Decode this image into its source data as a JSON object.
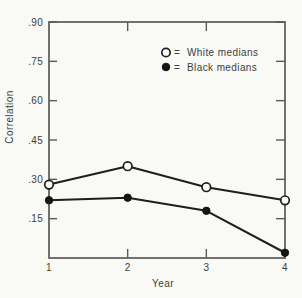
{
  "chart_data": {
    "type": "line",
    "title": "",
    "xlabel": "Year",
    "ylabel": "Correlation",
    "x": [
      1,
      2,
      3,
      4
    ],
    "x_tick_labels": [
      "1",
      "2",
      "3",
      "4"
    ],
    "y_ticks": [
      0.15,
      0.3,
      0.45,
      0.6,
      0.75,
      0.9
    ],
    "y_tick_labels": [
      ".15",
      ".30",
      ".45",
      ".60",
      ".75",
      ".90"
    ],
    "ylim": [
      0,
      0.9
    ],
    "xlim": [
      1,
      4
    ],
    "grid": false,
    "legend": {
      "position": "top-right-inside",
      "equals_sign": "=",
      "entries": [
        {
          "label": "White medians",
          "marker": "open-circle"
        },
        {
          "label": "Black medians",
          "marker": "filled-circle"
        }
      ]
    },
    "series": [
      {
        "name": "White medians",
        "marker": "open-circle",
        "values": [
          0.28,
          0.35,
          0.27,
          0.22
        ]
      },
      {
        "name": "Black medians",
        "marker": "filled-circle",
        "values": [
          0.22,
          0.23,
          0.18,
          0.02
        ]
      }
    ],
    "colors": {
      "background": "#f9f9f6",
      "frame": "#5a5a57",
      "line": "#1e1e1e",
      "text": "#3e3e3c"
    }
  }
}
